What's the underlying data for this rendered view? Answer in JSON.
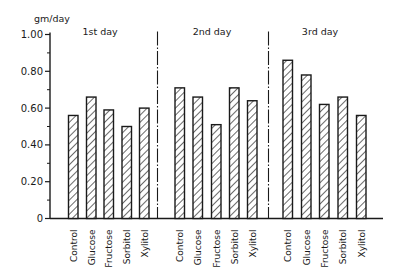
{
  "chart_data": {
    "type": "bar",
    "title": "",
    "ylabel": "gm/day",
    "xlabel": "",
    "ylim": [
      0,
      1.0
    ],
    "yticks": [
      0,
      0.2,
      0.4,
      0.6,
      0.8,
      1.0
    ],
    "ytick_labels": [
      "0",
      "0.20",
      "0.40",
      "0.60",
      "0.80",
      "1.00"
    ],
    "grid": false,
    "legend": null,
    "bar_style": "hatched (diagonal)",
    "groups": [
      {
        "label": "1st day",
        "categories": [
          "Control",
          "Glucose",
          "Fructose",
          "Sorbitol",
          "Xylitol"
        ],
        "values": [
          0.56,
          0.66,
          0.59,
          0.5,
          0.6
        ]
      },
      {
        "label": "2nd day",
        "categories": [
          "Control",
          "Glucose",
          "Fructose",
          "Sorbitol",
          "Xylitol"
        ],
        "values": [
          0.71,
          0.66,
          0.51,
          0.71,
          0.64
        ]
      },
      {
        "label": "3rd day",
        "categories": [
          "Control",
          "Glucose",
          "Fructose",
          "Sorbitol",
          "Xylitol"
        ],
        "values": [
          0.86,
          0.78,
          0.62,
          0.66,
          0.56
        ]
      }
    ],
    "group_separator": "dash-dot vertical line"
  },
  "layout": {
    "axis_x": 50,
    "baseline_y": 218.5,
    "top_y": 34.5,
    "axis_end_x": 383,
    "bar_width": 9.5,
    "group_bar_starts": [
      [
        68.5,
        86.5,
        104,
        122,
        139.5
      ],
      [
        175,
        193,
        211.5,
        229.5,
        247.5
      ],
      [
        283,
        301.5,
        319.5,
        338,
        356.5
      ]
    ],
    "group_label_x": [
      100,
      212,
      320
    ],
    "divider_x": [
      157.5,
      268.5
    ],
    "colors": {
      "ink": "#1a1a1a",
      "background": "#ffffff"
    }
  }
}
